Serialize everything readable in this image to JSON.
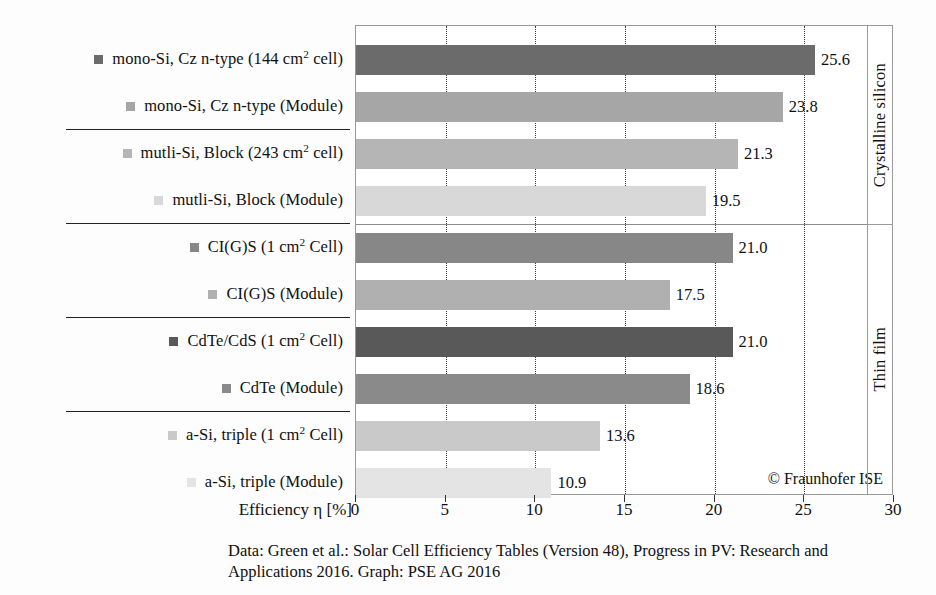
{
  "chart_data": {
    "type": "bar",
    "orientation": "horizontal",
    "title": "",
    "xlabel": "Efficiency η [%]",
    "ylabel": "",
    "xlim": [
      0,
      30
    ],
    "xticks": [
      0,
      5,
      10,
      15,
      20,
      25,
      30
    ],
    "gridlines": [
      5,
      10,
      15,
      20,
      25
    ],
    "grid": true,
    "legend": "none",
    "categories": [
      "mono-Si, Cz n-type (144 cm2 cell)",
      "mono-Si, Cz n-type (Module)",
      "mutli-Si, Block (243 cm2 cell)",
      "mutli-Si, Block (Module)",
      "CI(G)S (1 cm2 Cell)",
      "CI(G)S (Module)",
      "CdTe/CdS (1 cm2 Cell)",
      "CdTe (Module)",
      "a-Si, triple (1 cm2 Cell)",
      "a-Si, triple (Module)"
    ],
    "values": [
      25.6,
      23.8,
      21.3,
      19.5,
      21.0,
      17.5,
      21.0,
      18.6,
      13.6,
      10.9
    ],
    "value_labels": [
      "25.6",
      "23.8",
      "21.3",
      "19.5",
      "21.0",
      "17.5",
      "21.0",
      "18.6",
      "13.6",
      "10.9"
    ],
    "groups": [
      {
        "name": "Crystalline silicon",
        "start_index": 0,
        "end_index": 3
      },
      {
        "name": "Thin film",
        "start_index": 4,
        "end_index": 9
      }
    ],
    "annotations": [
      "© Fraunhofer ISE"
    ],
    "caption_lines": [
      "Data: Green et al.: Solar Cell Efficiency Tables (Version 48), Progress in PV: Research and",
      "Applications 2016. Graph: PSE AG 2016"
    ]
  },
  "categories": [
    {
      "label_html": "mono-Si, Cz n-type (144 cm<sup>2</sup> cell)",
      "value": 25.6,
      "value_label": "25.6",
      "color": "#6b6b6b",
      "swatch_color": "#6b6b6b"
    },
    {
      "label_html": "mono-Si, Cz n-type (Module)",
      "value": 23.8,
      "value_label": "23.8",
      "color": "#a6a6a6",
      "swatch_color": "#a6a6a6"
    },
    {
      "label_html": "mutli-Si, Block (243 cm<sup>2</sup> cell)",
      "value": 21.3,
      "value_label": "21.3",
      "color": "#b5b5b5",
      "swatch_color": "#b5b5b5"
    },
    {
      "label_html": "mutli-Si, Block (Module)",
      "value": 19.5,
      "value_label": "19.5",
      "color": "#d8d8d8",
      "swatch_color": "#d8d8d8"
    },
    {
      "label_html": "CI(G)S (1 cm<sup>2</sup> Cell)",
      "value": 21.0,
      "value_label": "21.0",
      "color": "#878787",
      "swatch_color": "#878787"
    },
    {
      "label_html": "CI(G)S (Module)",
      "value": 17.5,
      "value_label": "17.5",
      "color": "#b0b0b0",
      "swatch_color": "#b0b0b0"
    },
    {
      "label_html": "CdTe/CdS (1 cm<sup>2</sup> Cell)",
      "value": 21.0,
      "value_label": "21.0",
      "color": "#595959",
      "swatch_color": "#595959"
    },
    {
      "label_html": "CdTe (Module)",
      "value": 18.6,
      "value_label": "18.6",
      "color": "#8a8a8a",
      "swatch_color": "#8a8a8a"
    },
    {
      "label_html": "a-Si, triple (1 cm<sup>2</sup> Cell)",
      "value": 13.6,
      "value_label": "13.6",
      "color": "#c9c9c9",
      "swatch_color": "#c9c9c9"
    },
    {
      "label_html": "a-Si, triple (Module)",
      "value": 10.9,
      "value_label": "10.9",
      "color": "#e4e4e4",
      "swatch_color": "#e4e4e4"
    }
  ],
  "group_rules_after_index": [
    1,
    3,
    5,
    7
  ],
  "axis": {
    "title": "Efficiency η [%]",
    "ticks": [
      "0",
      "5",
      "10",
      "15",
      "20",
      "25",
      "30"
    ],
    "tick_values": [
      0,
      5,
      10,
      15,
      20,
      25,
      30
    ],
    "max": 30
  },
  "side_panel": {
    "top_label": "Crystalline silicon",
    "bottom_label": "Thin film"
  },
  "credit": "© Fraunhofer ISE",
  "caption": {
    "line1": "Data: Green et al.: Solar Cell Efficiency Tables (Version 48), Progress in PV: Research and",
    "line2": "Applications 2016. Graph: PSE AG 2016"
  }
}
